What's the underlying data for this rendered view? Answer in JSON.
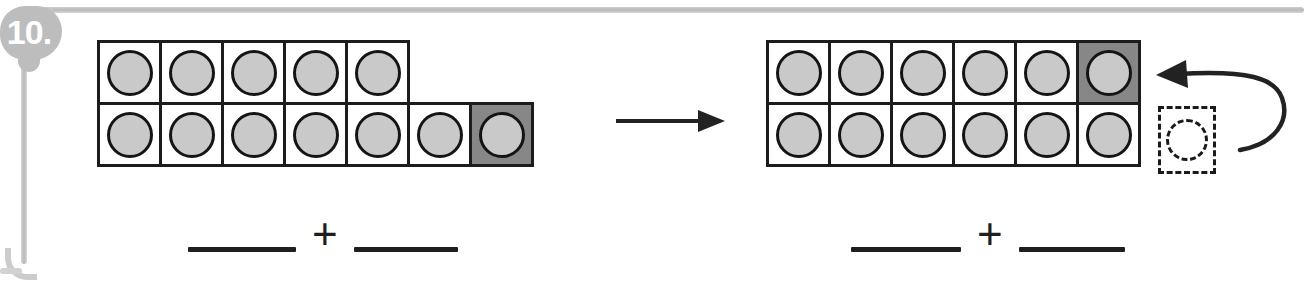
{
  "worksheet": {
    "problem_number": "10.",
    "instruction_type": "make-a-ten",
    "frame_color": "#c4c4c4",
    "badge_color": "#bdbdbd",
    "counter_color": "#c9c9c9",
    "shaded_cell_color": "#878787",
    "ink_color": "#1c1c1c"
  },
  "left_model": {
    "name": "before-ten-frame",
    "total_counters": 12,
    "rows": [
      {
        "row_index": 0,
        "cell_count": 5,
        "cells": [
          {
            "filled": true,
            "shaded": false
          },
          {
            "filled": true,
            "shaded": false
          },
          {
            "filled": true,
            "shaded": false
          },
          {
            "filled": true,
            "shaded": false
          },
          {
            "filled": true,
            "shaded": false
          }
        ]
      },
      {
        "row_index": 1,
        "cell_count": 7,
        "cells": [
          {
            "filled": true,
            "shaded": false
          },
          {
            "filled": true,
            "shaded": false
          },
          {
            "filled": true,
            "shaded": false
          },
          {
            "filled": true,
            "shaded": false
          },
          {
            "filled": true,
            "shaded": false
          },
          {
            "filled": true,
            "shaded": false
          },
          {
            "filled": true,
            "shaded": true
          }
        ]
      }
    ]
  },
  "right_model": {
    "name": "after-ten-frame",
    "total_counters": 12,
    "rows": [
      {
        "row_index": 0,
        "cell_count": 6,
        "cells": [
          {
            "filled": true,
            "shaded": false
          },
          {
            "filled": true,
            "shaded": false
          },
          {
            "filled": true,
            "shaded": false
          },
          {
            "filled": true,
            "shaded": false
          },
          {
            "filled": true,
            "shaded": false
          },
          {
            "filled": true,
            "shaded": true
          }
        ]
      },
      {
        "row_index": 1,
        "cell_count": 6,
        "cells": [
          {
            "filled": true,
            "shaded": false
          },
          {
            "filled": true,
            "shaded": false
          },
          {
            "filled": true,
            "shaded": false
          },
          {
            "filled": true,
            "shaded": false
          },
          {
            "filled": true,
            "shaded": false
          },
          {
            "filled": true,
            "shaded": false
          }
        ]
      }
    ],
    "vacated_slot": {
      "name": "dashed-empty-slot",
      "style": "dashed",
      "counter_outline": "dashed"
    }
  },
  "transform_arrow": {
    "name": "transform-arrow",
    "direction": "right",
    "style": "straight"
  },
  "move_arrow": {
    "name": "move-counter-arrow",
    "direction": "left",
    "style": "curved",
    "meaning": "counter moved from bottom row into top row"
  },
  "left_equation": {
    "name": "left-number-sentence",
    "blank_1": "",
    "blank_2": "",
    "operator": "+"
  },
  "right_equation": {
    "name": "right-number-sentence",
    "blank_1": "",
    "blank_2": "",
    "operator": "+"
  }
}
